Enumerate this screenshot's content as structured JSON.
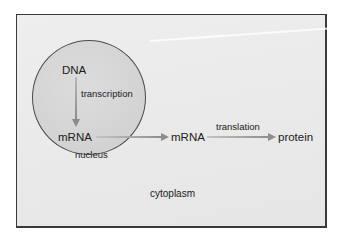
{
  "diagram": {
    "nodes": {
      "dna": "DNA",
      "mrna_nuclear": "mRNA",
      "mrna_cytoplasmic": "mRNA",
      "protein": "protein"
    },
    "processes": {
      "transcription": "transcription",
      "translation": "translation"
    },
    "compartments": {
      "nucleus": "nucleus",
      "cytoplasm": "cytoplasm"
    },
    "edges": [
      {
        "from": "DNA",
        "to": "mRNA (nucleus)",
        "label": "transcription"
      },
      {
        "from": "mRNA (nucleus)",
        "to": "mRNA (cytoplasm)",
        "label": ""
      },
      {
        "from": "mRNA (cytoplasm)",
        "to": "protein",
        "label": "translation"
      }
    ],
    "colors": {
      "frame_border": "#3a3a3a",
      "frame_fill": "#eaeaea",
      "nucleus_fill": "#d6d6d6",
      "nucleus_border": "#4a4a4a",
      "arrow": "#9a9a9a",
      "text": "#1a1a1a"
    }
  }
}
